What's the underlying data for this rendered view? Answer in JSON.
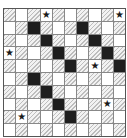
{
  "puzzle": {
    "rows": 10,
    "cols": 10,
    "pattern": "checkerboard-hatched-even",
    "black_cells": [
      [
        1,
        2
      ],
      [
        1,
        6
      ],
      [
        2,
        3
      ],
      [
        2,
        7
      ],
      [
        3,
        4
      ],
      [
        3,
        8
      ],
      [
        4,
        5
      ],
      [
        4,
        9
      ],
      [
        5,
        2
      ],
      [
        6,
        3
      ],
      [
        7,
        4
      ],
      [
        8,
        5
      ]
    ],
    "star_cells": [
      [
        0,
        3
      ],
      [
        0,
        9
      ],
      [
        3,
        0
      ],
      [
        4,
        7
      ],
      [
        7,
        8
      ],
      [
        8,
        1
      ]
    ],
    "star_icon": "★",
    "colors": {
      "black": "#1e1e1e",
      "hatch": "#bdbdbd",
      "white": "#ffffff",
      "grid": "#888888"
    }
  }
}
